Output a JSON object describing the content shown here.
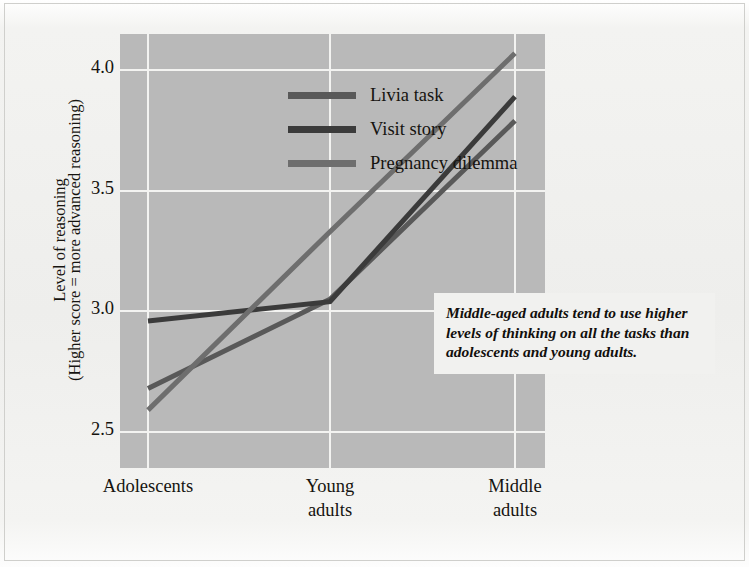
{
  "chart_data": {
    "type": "line",
    "title": "",
    "xlabel": "",
    "ylabel": "Level of reasoning (Higher score = more advanced reasoning)",
    "categories": [
      "Adolescents",
      "Young adults",
      "Middle adults"
    ],
    "ylim": [
      2.35,
      4.15
    ],
    "yticks": [
      "4.0",
      "3.5",
      "3.0",
      "2.5"
    ],
    "ytick_values": [
      4.0,
      3.5,
      3.0,
      2.5
    ],
    "grid": true,
    "legend_position": "top-left-inside",
    "series": [
      {
        "name": "Livia task",
        "values": [
          2.68,
          3.05,
          3.79
        ],
        "color": "#595959"
      },
      {
        "name": "Visit story",
        "values": [
          2.96,
          3.04,
          3.89
        ],
        "color": "#3b3b3b"
      },
      {
        "name": "Pregnancy dilemma",
        "values": [
          2.59,
          3.33,
          4.07
        ],
        "color": "#6e6e6e"
      }
    ],
    "annotation": "Middle-aged adults tend to use higher levels of thinking on all the tasks than adolescents and young adults."
  },
  "axis": {
    "y_title_line1": "Level of reasoning",
    "y_title_line2": "(Higher score = more advanced reasoning)",
    "y_ticks": [
      "4.0",
      "3.5",
      "3.0",
      "2.5"
    ],
    "x_labels": [
      {
        "line1": "Adolescents",
        "line2": ""
      },
      {
        "line1": "Young",
        "line2": "adults"
      },
      {
        "line1": "Middle",
        "line2": "adults"
      }
    ]
  },
  "legend": {
    "items": [
      {
        "label": "Livia task",
        "color": "#595959"
      },
      {
        "label": "Visit story",
        "color": "#3b3b3b"
      },
      {
        "label": "Pregnancy dilemma",
        "color": "#6e6e6e"
      }
    ]
  },
  "annotation": {
    "text": "Middle-aged adults tend to use higher levels of thinking on all the tasks than adolescents and young adults."
  },
  "colors": {
    "page_background": "#f2f2f0",
    "plot_background": "#b9b9b9",
    "gridline": "#f3f3f1",
    "text": "#15130f",
    "annotation_background": "#f1f1ef"
  }
}
